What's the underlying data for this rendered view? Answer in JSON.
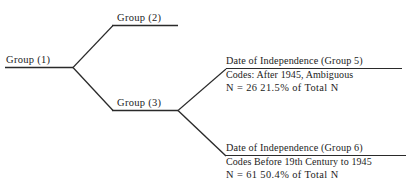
{
  "figure": {
    "type": "tree-diagram",
    "background_color": "#ffffff",
    "line_color": "#2a2a2a",
    "text_color": "#1c1c1c"
  },
  "nodes": {
    "root": {
      "label": "Group (1)"
    },
    "branch_upper": {
      "label": "Group (2)"
    },
    "branch_lower": {
      "label": "Group (3)"
    }
  },
  "leaves": [
    {
      "id": "group5",
      "title": "Date of Independence (Group 5)",
      "codes": "Codes: After 1945, Ambiguous",
      "stats": "N = 26  21.5% of Total N",
      "n": 26,
      "percent_of_total": "21.5%"
    },
    {
      "id": "group6",
      "title": "Date of Independence (Group 6)",
      "codes": "Codes  Before 19th Century to 1945",
      "stats": "N = 61  50.4% of Total N",
      "n": 61,
      "percent_of_total": "50.4%"
    }
  ]
}
